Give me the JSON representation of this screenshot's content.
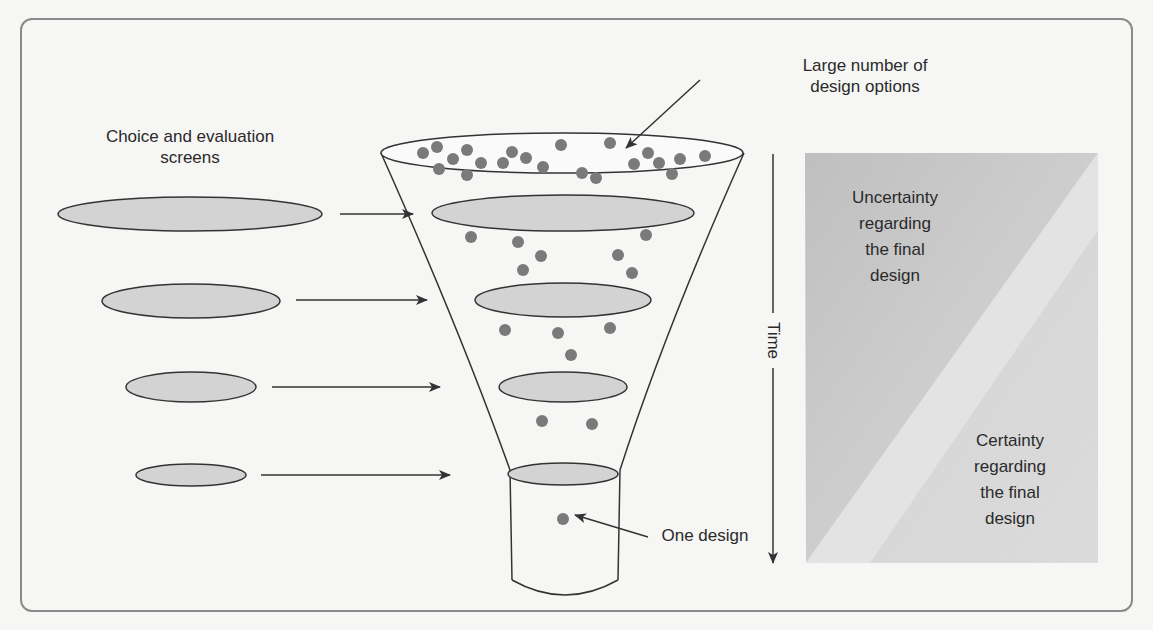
{
  "labels": {
    "screens": "Choice and evaluation\nscreens",
    "screens_line1": "Choice and evaluation",
    "screens_line2": "screens",
    "large_number_line1": "Large number of",
    "large_number_line2": "design options",
    "one_design": "One design",
    "time": "Time",
    "uncertainty": [
      "Uncertainty",
      "regarding",
      "the final",
      "design"
    ],
    "certainty": [
      "Certainty",
      "regarding",
      "the final",
      "design"
    ]
  },
  "colors": {
    "dot": "#7a7a7a",
    "screen_fill": "#d3d3d3",
    "stroke": "#333333",
    "panel_dark": "#c4c4c4",
    "panel_light": "#ececec"
  },
  "funnel_stages": [
    {
      "name": "top",
      "dots": 24
    },
    {
      "name": "stage-1",
      "dots": 7
    },
    {
      "name": "stage-2",
      "dots": 4
    },
    {
      "name": "stage-3",
      "dots": 2
    },
    {
      "name": "stage-4",
      "dots": 1
    }
  ]
}
